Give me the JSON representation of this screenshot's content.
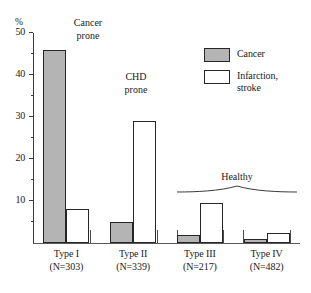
{
  "chart_data": {
    "type": "bar",
    "title": "",
    "xlabel": "",
    "ylabel": "%",
    "ylim": [
      0,
      50
    ],
    "ytick_labels": [
      "10",
      "20",
      "30",
      "40",
      "50"
    ],
    "ytick_values": [
      10,
      20,
      30,
      40,
      50
    ],
    "minor_tick_values": [
      5,
      15,
      25,
      35,
      45
    ],
    "grid": false,
    "legend_position": "top-right",
    "categories": [
      "Type I",
      "Type II",
      "Type III",
      "Type IV"
    ],
    "category_sublabels": [
      "(N=303)",
      "(N=339)",
      "(N=217)",
      "(N=482)"
    ],
    "series": [
      {
        "name": "Cancer",
        "color": "#b4b4b4",
        "values": [
          46,
          5,
          2,
          1
        ]
      },
      {
        "name": "Infarction, stroke",
        "color": "#ffffff",
        "values": [
          8,
          29,
          9.5,
          2.5
        ]
      }
    ],
    "annotations": [
      {
        "text_line1": "Cancer",
        "text_line2": "prone",
        "target": "Type I"
      },
      {
        "text_line1": "CHD",
        "text_line2": "prone",
        "target": "Type II"
      },
      {
        "text_line1": "Healthy",
        "text_line2": "",
        "target": "Type III + Type IV"
      }
    ]
  },
  "axis": {
    "unit_symbol": "%"
  },
  "legend": {
    "items": [
      {
        "label_line1": "Cancer",
        "label_line2": ""
      },
      {
        "label_line1": "Infarction,",
        "label_line2": "stroke"
      }
    ]
  },
  "callouts": {
    "cancer_prone_l1": "Cancer",
    "cancer_prone_l2": "prone",
    "chd_prone_l1": "CHD",
    "chd_prone_l2": "prone",
    "healthy": "Healthy"
  },
  "colors": {
    "cancer_fill": "#b4b4b4",
    "infarction_fill": "#ffffff",
    "bar_stroke": "#262626",
    "axis": "#3b3b3b"
  }
}
